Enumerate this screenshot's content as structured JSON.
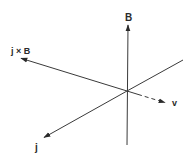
{
  "diagram": {
    "type": "3d-vector-axes",
    "colors": {
      "line": "#3a3a3a",
      "text": "#2a2a2a",
      "background": "#ffffff"
    },
    "origin": [
      127,
      91
    ],
    "vectors": [
      {
        "id": "B",
        "label": "B",
        "style": "solid",
        "from": [
          127,
          145
        ],
        "to": [
          128,
          24
        ],
        "arrow": true,
        "label_pos": [
          128,
          20
        ]
      },
      {
        "id": "jxB",
        "label": "j × B",
        "style": "solid",
        "from": [
          127,
          91
        ],
        "to": [
          20,
          58
        ],
        "arrow": true,
        "label_pos": [
          11,
          54
        ]
      },
      {
        "id": "j",
        "label": "j",
        "style": "solid",
        "from": [
          127,
          91
        ],
        "to": [
          43,
          138
        ],
        "arrow": true,
        "label_pos": [
          36,
          150
        ]
      },
      {
        "id": "v",
        "label": "v",
        "style": "dashed",
        "from": [
          127,
          91
        ],
        "to": [
          166,
          103
        ],
        "arrow": true,
        "label_pos": [
          173,
          107
        ]
      },
      {
        "id": "axis-ur",
        "label": "",
        "style": "solid",
        "from": [
          127,
          91
        ],
        "to": [
          183,
          60
        ],
        "arrow": false
      }
    ]
  },
  "labels": {
    "B": "B",
    "jxB": "j × B",
    "j": "j",
    "v": "v"
  }
}
